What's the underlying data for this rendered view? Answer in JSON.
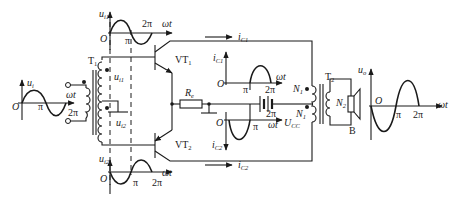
{
  "diagram": {
    "type": "push-pull power amplifier (transformer coupled, class B)",
    "components": {
      "input_transformer": "T1",
      "output_transformer": "T2",
      "transistor_top": "VT1",
      "transistor_bottom": "VT2",
      "resistor": "Re",
      "supply": "UCC",
      "primary_turns": "N1",
      "secondary_turns": "N2",
      "speaker": "B"
    },
    "labels": {
      "omega_t": "ωt",
      "origin": "O",
      "pi": "π",
      "two_pi": "2π"
    },
    "waveforms": {
      "input": {
        "name": "u",
        "sub": "i",
        "shape": "sine"
      },
      "top_input": {
        "name": "u",
        "sub": "i1",
        "shape": "sine"
      },
      "bottom_input": {
        "name": "u",
        "sub": "i2",
        "shape": "inverted sine"
      },
      "collector1": {
        "name": "i",
        "sub": "C1",
        "shape": "positive half-wave (π to 2π)"
      },
      "collector2": {
        "name": "i",
        "sub": "C2",
        "shape": "negative half-wave (0 to π)"
      },
      "output": {
        "name": "u",
        "sub": "o",
        "shape": "inverted sine"
      }
    },
    "currents": {
      "top_arrow": {
        "name": "i",
        "sub": "C1"
      },
      "bottom_arrow": {
        "name": "i",
        "sub": "C2"
      }
    },
    "winding_labels": {
      "upper_secondary": {
        "name": "u",
        "sub": "i1"
      },
      "lower_secondary": {
        "name": "u",
        "sub": "i2"
      }
    }
  }
}
